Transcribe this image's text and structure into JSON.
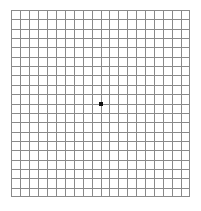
{
  "chart_data": {
    "type": "table",
    "columns": 20,
    "rows": 20,
    "cell_size_px": 8.95,
    "grid": {
      "left_px": 11,
      "top_px": 10,
      "width_px": 179,
      "height_px": 187
    },
    "line_color": "#8a8a8a",
    "line_width_px": 1,
    "background_color": "#ffffff",
    "border_color": "#8a8a8a",
    "fixation_dot": {
      "label": "central fixation dot",
      "color": "#111111",
      "size_px": 4,
      "center_x_px": 101,
      "center_y_px": 104,
      "grid_column": 10,
      "grid_row": 10
    },
    "xlabel": "",
    "ylabel": "",
    "legend": [],
    "annotations": [],
    "grid_on": true
  },
  "chart": {
    "name": "amsler-grid"
  }
}
